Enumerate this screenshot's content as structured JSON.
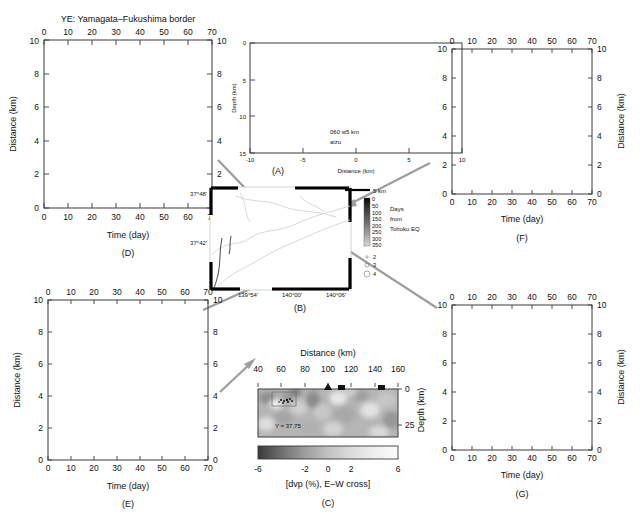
{
  "figure": {
    "title": "YE: Yamagata–Fukushima border",
    "panels": [
      "(A)",
      "(B)",
      "(C)",
      "(D)",
      "(E)",
      "(F)",
      "(G)"
    ]
  },
  "panel_a": {
    "label": "(A)",
    "xlabel": "Distance (km)",
    "ylabel": "Depth (km)",
    "xticks": [
      "-10",
      "-5",
      "0",
      "5",
      "10"
    ],
    "yticks": [
      "0",
      "5",
      "10",
      "15"
    ],
    "annotation_line1": "060 w5 km",
    "annotation_line2": "aizu",
    "xlim": [
      -10,
      10
    ],
    "ylim": [
      0,
      15
    ]
  },
  "panel_b": {
    "label": "(B)",
    "lat_ticks": [
      "37°48'",
      "37°42'"
    ],
    "lon_ticks": [
      "139°54'",
      "140°00'",
      "140°06'"
    ],
    "scalebar": "5 km",
    "colorbar_title_line1": "Days",
    "colorbar_title_line2": "from",
    "colorbar_title_line3": "Tohoku EQ",
    "colorbar_ticks": [
      "0",
      "50",
      "100",
      "150",
      "200",
      "250",
      "300",
      "350"
    ],
    "magnitude_ticks": [
      "2",
      "3",
      "4"
    ]
  },
  "panel_c": {
    "label": "(C)",
    "xlabel": "Distance (km)",
    "ylabel": "Depth (km)",
    "xticks": [
      "40",
      "60",
      "80",
      "100",
      "120",
      "140",
      "160"
    ],
    "yticks": [
      "0",
      "25"
    ],
    "annotation": "Y = 37.75",
    "colorbar_label": "[dvp (%), E–W cross]",
    "colorbar_ticks": [
      "-6",
      "-2",
      "0",
      "2",
      "6"
    ],
    "colorbar_range": [
      -6,
      6
    ]
  },
  "panel_d": {
    "label": "(D)",
    "xlabel": "Time (day)",
    "ylabel": "Distance (km)",
    "xticks": [
      "0",
      "10",
      "20",
      "30",
      "40",
      "50",
      "60",
      "70"
    ],
    "yticks": [
      "0",
      "2",
      "4",
      "6",
      "8",
      "10"
    ],
    "xlim": [
      0,
      70
    ],
    "ylim": [
      0,
      10
    ]
  },
  "panel_e": {
    "label": "(E)",
    "xlabel": "Time (day)",
    "ylabel": "Distance (km)",
    "xticks": [
      "0",
      "10",
      "20",
      "30",
      "40",
      "50",
      "60",
      "70"
    ],
    "yticks": [
      "0",
      "2",
      "4",
      "6",
      "8",
      "10"
    ],
    "xlim": [
      0,
      70
    ],
    "ylim": [
      0,
      10
    ]
  },
  "panel_f": {
    "label": "(F)",
    "xlabel": "Time (day)",
    "ylabel": "Distance (km)",
    "xticks": [
      "0",
      "10",
      "20",
      "30",
      "40",
      "50",
      "60",
      "70"
    ],
    "yticks": [
      "0",
      "2",
      "4",
      "6",
      "8",
      "10"
    ],
    "xlim": [
      0,
      70
    ],
    "ylim": [
      0,
      10
    ]
  },
  "panel_g": {
    "label": "(G)",
    "xlabel": "Time (day)",
    "ylabel": "Distance (km)",
    "xticks": [
      "0",
      "10",
      "20",
      "30",
      "40",
      "50",
      "60",
      "70"
    ],
    "yticks": [
      "0",
      "2",
      "4",
      "6",
      "8",
      "10"
    ],
    "xlim": [
      0,
      70
    ],
    "ylim": [
      0,
      10
    ]
  },
  "chart_data": [
    {
      "type": "scatter",
      "id": "A",
      "title": "Depth cross-section of hypocenters (aizu, 060 w5 km)",
      "xlabel": "Distance (km)",
      "ylabel": "Depth (km)",
      "xlim": [
        -10,
        10
      ],
      "ylim": [
        15,
        0
      ],
      "grid": false,
      "description": "Dense elongated cluster of earthquake hypocenters at 7-10 km depth spanning x = -7 to 8 km, forming three sub-clusters",
      "clusters": [
        {
          "x_center": -5.0,
          "y_center": 8.7,
          "x_spread": 2.2,
          "y_spread": 0.55,
          "n": 420
        },
        {
          "x_center": 0.8,
          "y_center": 8.2,
          "x_spread": 1.8,
          "y_spread": 1.0,
          "n": 480
        },
        {
          "x_center": 6.0,
          "y_center": 8.0,
          "x_spread": 1.5,
          "y_spread": 0.8,
          "n": 300
        }
      ]
    },
    {
      "type": "heatmap",
      "id": "C",
      "title": "E-W velocity perturbation cross section",
      "xlabel": "Distance (km)",
      "ylabel": "Depth (km)",
      "xlim": [
        40,
        160
      ],
      "ylim": [
        25,
        0
      ],
      "annotation": "Y = 37.75",
      "colorbar_label": "[dvp (%), E–W cross]",
      "colorbar_range": [
        -6,
        6
      ],
      "colorbar_ticks": [
        -6,
        -2,
        0,
        2,
        6
      ]
    },
    {
      "type": "scatter",
      "id": "D",
      "title": "Distance vs time migration (D)",
      "xlabel": "Time (day)",
      "ylabel": "Distance (km)",
      "xlim": [
        0,
        70
      ],
      "ylim": [
        0,
        10
      ],
      "grid": false,
      "description": "Seismicity migration front rising from 0.3 km at day 8 to about 2.3 km by day 68; dense dark core between days 10-40",
      "envelope": {
        "x": [
          7,
          10,
          15,
          20,
          25,
          30,
          35,
          40,
          45,
          50,
          55,
          60,
          65,
          70
        ],
        "y_upper": [
          0.6,
          1.3,
          1.5,
          1.7,
          1.8,
          1.9,
          1.9,
          2.0,
          2.0,
          2.1,
          2.2,
          2.3,
          2.4,
          2.5
        ]
      },
      "n_points": 1500
    },
    {
      "type": "scatter",
      "id": "E",
      "title": "Distance vs time migration (E)",
      "xlabel": "Time (day)",
      "ylabel": "Distance (km)",
      "xlim": [
        0,
        70
      ],
      "ylim": [
        0,
        10
      ],
      "grid": false,
      "description": "Sparse seismicity starting near day 20 at about 0.7 km, slowly expanding to 2-3 km by day 68",
      "n_points": 110
    },
    {
      "type": "scatter",
      "id": "F",
      "title": "Distance vs time migration (F)",
      "xlabel": "Time (day)",
      "ylabel": "Distance (km)",
      "xlim": [
        0,
        70
      ],
      "ylim": [
        0,
        10
      ],
      "grid": false,
      "description": "Broad cloud starting day 12, peak density days 20-35 with distances up to 4.5 km, tapering to about 1.3 km after day 50",
      "n_points": 1400
    },
    {
      "type": "scatter",
      "id": "G",
      "title": "Distance vs time migration (G)",
      "xlabel": "Time (day)",
      "ylabel": "Distance (km)",
      "xlim": [
        0,
        70
      ],
      "ylim": [
        0,
        10
      ],
      "grid": false,
      "description": "Very dense seismicity onset at day 6 filling 0-6 km by day 15, saturated core to day 30, thinning tail to day 70",
      "n_points": 4000
    }
  ]
}
